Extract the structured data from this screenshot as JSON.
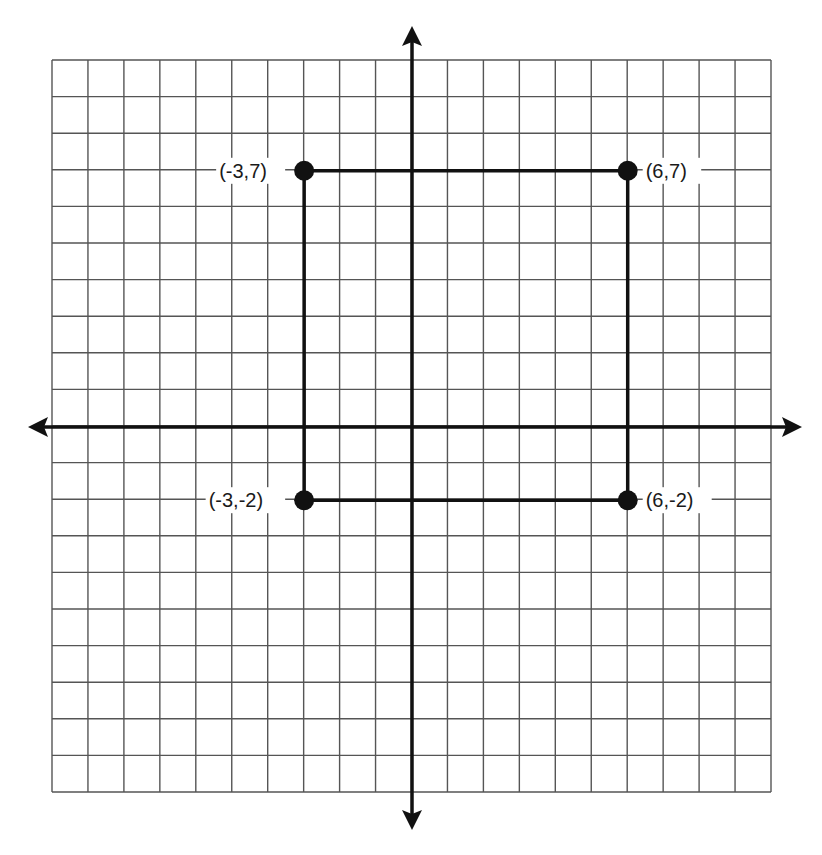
{
  "diagram": {
    "type": "coordinate-plane",
    "grid": {
      "xmin": -10,
      "xmax": 10,
      "ymin": -10,
      "ymax": 10,
      "cells_x": 20,
      "cells_y": 20
    },
    "colors": {
      "grid": "#555555",
      "axis": "#111111",
      "shape": "#111111",
      "background": "#ffffff"
    },
    "shape": "rectangle",
    "points": [
      {
        "x": -3,
        "y": 7,
        "label": "(-3,7)",
        "label_side": "left"
      },
      {
        "x": 6,
        "y": 7,
        "label": "(6,7)",
        "label_side": "right"
      },
      {
        "x": 6,
        "y": -2,
        "label": "(6,-2)",
        "label_side": "right"
      },
      {
        "x": -3,
        "y": -2,
        "label": "(-3,-2)",
        "label_side": "left"
      }
    ]
  }
}
